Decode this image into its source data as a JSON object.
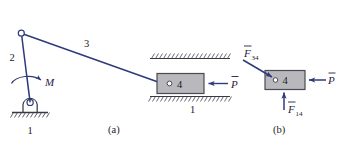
{
  "figure": {
    "background_color": "#ffffff",
    "line_color": "#2e3a7a",
    "block_fill": "#b9b9bd",
    "block_stroke": "#4a4a55",
    "ground_color": "#3a3a46",
    "panel_a": {
      "caption": "(a)",
      "labels": {
        "link2": "2",
        "link3": "3",
        "ground1": "1",
        "ground1_slider": "1",
        "block4": "4",
        "moment": "M",
        "force_P": "P"
      },
      "joint_top_name": "revolute-joint-top",
      "joint_bottom_name": "pin-support",
      "slider_block_name": "slider-block-4"
    },
    "panel_b": {
      "caption": "(b)",
      "labels": {
        "block4": "4",
        "force_F34": "F",
        "force_F34_sub": "34",
        "force_F14": "F",
        "force_F14_sub": "14",
        "force_P": "P"
      }
    }
  }
}
